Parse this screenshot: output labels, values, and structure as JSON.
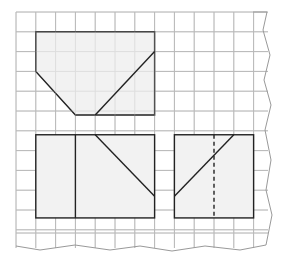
{
  "figure": {
    "colors": {
      "background": "#ffffff",
      "grid_line": "#b8b8b8",
      "shape_fill": "#f2f2f2",
      "shape_stroke": "#222222"
    },
    "grid": {
      "origin_x": 16,
      "origin_y": 12,
      "cell": 19.8,
      "cols": 12,
      "rows": 12
    },
    "shapes": [
      {
        "name": "top-pentagon",
        "points": [
          [
            1,
            1
          ],
          [
            7,
            1
          ],
          [
            7,
            5.2
          ],
          [
            4,
            5.2
          ],
          [
            3,
            5.2
          ],
          [
            1,
            3
          ]
        ],
        "diagonals": [
          [
            [
              7,
              2
            ],
            [
              4,
              5.2
            ]
          ]
        ]
      },
      {
        "name": "bottom-left-rectangle",
        "rect": [
          1,
          6.2,
          6,
          4.2
        ],
        "lines": [
          [
            [
              3,
              6.2
            ],
            [
              3,
              10.4
            ]
          ]
        ],
        "diagonals": [
          [
            [
              4,
              6.2
            ],
            [
              7,
              9.3
            ]
          ]
        ]
      },
      {
        "name": "bottom-right-rectangle",
        "rect": [
          8,
          6.2,
          4,
          4.2
        ],
        "diagonals": [
          [
            [
              11,
              6.2
            ],
            [
              8,
              9.3
            ]
          ]
        ],
        "dashed": [
          [
            [
              10,
              6.2
            ],
            [
              10,
              10.4
            ]
          ]
        ]
      }
    ]
  }
}
